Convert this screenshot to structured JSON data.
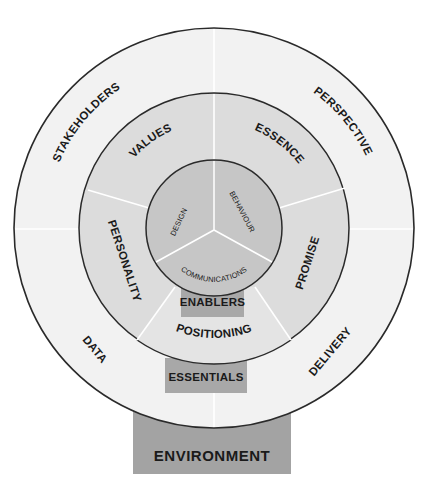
{
  "diagram": {
    "title": "",
    "colors": {
      "background": "#ffffff",
      "outer_ring": "#f2f2f2",
      "middle_ring": "#dcdcdc",
      "inner_circle": "#c6c6c6",
      "box": "#a8a8a8",
      "environment_box": "#a3a3a3",
      "stroke": "#2a2a2a",
      "divider": "#ffffff"
    },
    "outer_ring": {
      "labels": {
        "top_left": "STAKEHOLDERS",
        "top_right": "PERSPECTIVE",
        "bottom_left": "DATA",
        "bottom_right": "DELIVERY"
      }
    },
    "middle_ring": {
      "labels": {
        "top_left": "VALUES",
        "top_right": "ESSENCE",
        "left": "PERSONALITY",
        "right": "PROMISE",
        "bottom": "POSITIONING"
      }
    },
    "inner_circle": {
      "labels": {
        "left": "DESIGN",
        "right": "BEHAVIOUR",
        "bottom": "COMMUNICATIONS"
      }
    },
    "boxes": {
      "enablers": "ENABLERS",
      "essentials": "ESSENTIALS",
      "environment": "ENVIRONMENT"
    }
  }
}
